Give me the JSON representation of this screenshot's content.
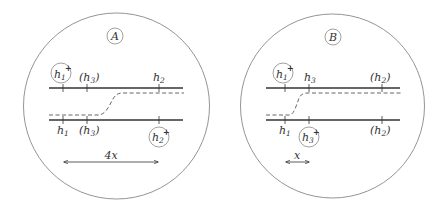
{
  "colors": {
    "line": "#333333",
    "outline": "#888888",
    "background": "#ffffff"
  },
  "panels": [
    {
      "id": "A",
      "title": "A",
      "top_labels": [
        {
          "text": "h",
          "sub": "1",
          "plus": "+",
          "circled": true,
          "paren": false
        },
        {
          "text": "h",
          "sub": "3",
          "plus": "",
          "circled": false,
          "paren": true
        },
        {
          "text": "h",
          "sub": "2",
          "plus": "",
          "circled": false,
          "paren": false
        }
      ],
      "bottom_labels": [
        {
          "text": "h",
          "sub": "1",
          "plus": "",
          "circled": false,
          "paren": false
        },
        {
          "text": "h",
          "sub": "3",
          "plus": "",
          "circled": false,
          "paren": true
        },
        {
          "text": "h",
          "sub": "2",
          "plus": "+",
          "circled": true,
          "paren": false
        }
      ],
      "distance_label": "4x"
    },
    {
      "id": "B",
      "title": "B",
      "top_labels": [
        {
          "text": "h",
          "sub": "1",
          "plus": "+",
          "circled": true,
          "paren": false
        },
        {
          "text": "h",
          "sub": "3",
          "plus": "",
          "circled": false,
          "paren": false
        },
        {
          "text": "h",
          "sub": "2",
          "plus": "",
          "circled": false,
          "paren": true
        }
      ],
      "bottom_labels": [
        {
          "text": "h",
          "sub": "1",
          "plus": "",
          "circled": false,
          "paren": false
        },
        {
          "text": "h",
          "sub": "3",
          "plus": "+",
          "circled": true,
          "paren": false
        },
        {
          "text": "h",
          "sub": "2",
          "plus": "",
          "circled": false,
          "paren": true
        }
      ],
      "distance_label": "x"
    }
  ],
  "text": {
    "A_title": "A",
    "B_title": "B",
    "A_dist": "4x",
    "B_dist": "x",
    "h": "h",
    "s1": "1",
    "s2": "2",
    "s3": "3",
    "plus": "+",
    "lp": "(",
    "rp": ")"
  }
}
